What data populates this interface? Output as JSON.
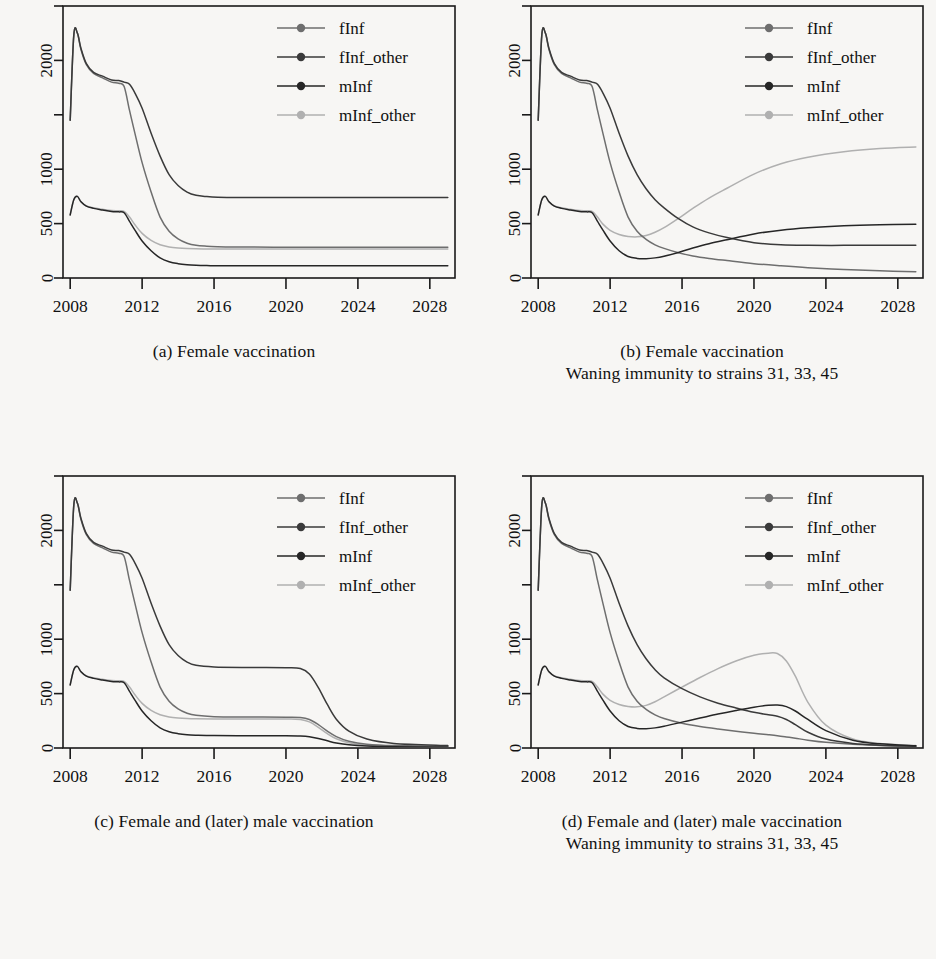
{
  "figure": {
    "background": "#f7f6f4",
    "panel_count": 4,
    "axis_color": "#1a1a1a"
  },
  "series_style": {
    "fInf": "#6e6e6e",
    "fInf_other": "#3a3a3a",
    "mInf": "#262626",
    "mInf_other": "#b0b0b0"
  },
  "legend": {
    "items": [
      {
        "label": "fInf",
        "color": "#6e6e6e"
      },
      {
        "label": "fInf_other",
        "color": "#3a3a3a"
      },
      {
        "label": "mInf",
        "color": "#262626"
      },
      {
        "label": "mInf_other",
        "color": "#b0b0b0"
      }
    ]
  },
  "axes": {
    "xlim": [
      2007.6,
      2029.4
    ],
    "ylim": [
      0,
      2500
    ],
    "xticks": [
      2008,
      2012,
      2016,
      2020,
      2024,
      2028
    ],
    "xtick_labels": [
      "2008",
      "2012",
      "2016",
      "2020",
      "2024",
      "2028"
    ],
    "yticks": [
      0,
      500,
      1000,
      1500,
      2000,
      2500
    ],
    "ytick_labels": [
      "0",
      "500",
      "1000",
      "",
      "2000",
      ""
    ],
    "grid": false,
    "legend_position": "top-right"
  },
  "panels": [
    {
      "id": "a",
      "caption_lines": [
        "(a) Female vaccination"
      ],
      "chart_data": {
        "type": "line",
        "title": "(a) Female vaccination",
        "xlabel": "",
        "ylabel": "",
        "xlim": [
          2007.6,
          2029.4
        ],
        "ylim": [
          0,
          2500
        ],
        "x": [
          2008.0,
          2008.2,
          2008.4,
          2008.6,
          2008.9,
          2009.3,
          2009.8,
          2010.3,
          2010.7,
          2011.0,
          2011.3,
          2011.6,
          2012.0,
          2012.5,
          2013.0,
          2013.5,
          2014.0,
          2014.5,
          2015.0,
          2015.6,
          2016.2,
          2017.0,
          2018.0,
          2020.0,
          2022.0,
          2024.0,
          2026.0,
          2029.0
        ],
        "series": [
          {
            "name": "fInf",
            "color": "#6e6e6e",
            "values": [
              1450,
              2230,
              2250,
              2100,
              1960,
              1880,
              1840,
              1800,
              1790,
              1760,
              1540,
              1330,
              1060,
              790,
              560,
              430,
              360,
              320,
              300,
              292,
              288,
              285,
              284,
              283,
              283,
              283,
              283,
              283
            ]
          },
          {
            "name": "fInf_other",
            "color": "#3a3a3a",
            "values": [
              1450,
              2230,
              2250,
              2110,
              1970,
              1890,
              1855,
              1820,
              1815,
              1800,
              1780,
              1700,
              1560,
              1330,
              1120,
              950,
              850,
              790,
              760,
              748,
              742,
              740,
              740,
              740,
              740,
              740,
              740,
              740
            ]
          },
          {
            "name": "mInf",
            "color": "#262626",
            "values": [
              580,
              720,
              750,
              700,
              660,
              640,
              625,
              612,
              608,
              600,
              520,
              440,
              340,
              250,
              185,
              150,
              132,
              122,
              117,
              114,
              113,
              112,
              112,
              112,
              112,
              112,
              112,
              112
            ]
          },
          {
            "name": "mInf_other",
            "color": "#b0b0b0",
            "values": [
              580,
              720,
              750,
              700,
              662,
              645,
              632,
              620,
              618,
              612,
              560,
              490,
              410,
              345,
              305,
              285,
              275,
              270,
              268,
              267,
              267,
              267,
              267,
              267,
              267,
              267,
              267,
              267
            ]
          }
        ]
      }
    },
    {
      "id": "b",
      "caption_lines": [
        "(b) Female vaccination",
        "Waning immunity to strains 31, 33, 45"
      ],
      "chart_data": {
        "type": "line",
        "title": "(b) Female vaccination - Waning immunity to strains 31, 33, 45",
        "xlabel": "",
        "ylabel": "",
        "xlim": [
          2007.6,
          2029.4
        ],
        "ylim": [
          0,
          2500
        ],
        "x": [
          2008.0,
          2008.2,
          2008.4,
          2008.6,
          2008.9,
          2009.3,
          2009.8,
          2010.3,
          2010.7,
          2011.0,
          2011.3,
          2011.6,
          2012.0,
          2012.5,
          2013.0,
          2013.5,
          2014.0,
          2014.5,
          2015.0,
          2015.8,
          2016.6,
          2017.5,
          2018.5,
          2020.0,
          2021.5,
          2023.0,
          2025.0,
          2027.0,
          2029.0
        ],
        "series": [
          {
            "name": "fInf",
            "color": "#6e6e6e",
            "values": [
              1450,
              2230,
              2250,
              2100,
              1960,
              1880,
              1840,
              1800,
              1790,
              1760,
              1540,
              1330,
              1060,
              790,
              560,
              430,
              355,
              305,
              272,
              232,
              203,
              180,
              160,
              132,
              112,
              95,
              78,
              66,
              58
            ]
          },
          {
            "name": "fInf_other",
            "color": "#3a3a3a",
            "values": [
              1450,
              2230,
              2250,
              2110,
              1970,
              1890,
              1855,
              1820,
              1815,
              1800,
              1780,
              1700,
              1560,
              1330,
              1120,
              950,
              820,
              720,
              645,
              545,
              470,
              415,
              372,
              325,
              305,
              300,
              300,
              300,
              300
            ]
          },
          {
            "name": "mInf",
            "color": "#262626",
            "values": [
              580,
              720,
              750,
              700,
              660,
              640,
              625,
              612,
              608,
              600,
              520,
              440,
              340,
              250,
              198,
              180,
              178,
              185,
              200,
              235,
              275,
              315,
              352,
              405,
              440,
              462,
              480,
              490,
              495
            ]
          },
          {
            "name": "mInf_other",
            "color": "#b0b0b0",
            "values": [
              580,
              720,
              750,
              700,
              662,
              645,
              632,
              620,
              618,
              612,
              560,
              495,
              438,
              400,
              382,
              378,
              390,
              420,
              462,
              548,
              640,
              735,
              825,
              955,
              1050,
              1110,
              1160,
              1190,
              1205
            ]
          }
        ]
      }
    },
    {
      "id": "c",
      "caption_lines": [
        "(c) Female and (later) male vaccination"
      ],
      "chart_data": {
        "type": "line",
        "title": "(c) Female and (later) male vaccination",
        "xlabel": "",
        "ylabel": "",
        "xlim": [
          2007.6,
          2029.4
        ],
        "ylim": [
          0,
          2500
        ],
        "x": [
          2008.0,
          2008.2,
          2008.4,
          2008.6,
          2008.9,
          2009.3,
          2009.8,
          2010.3,
          2010.7,
          2011.0,
          2011.3,
          2011.6,
          2012.0,
          2012.5,
          2013.0,
          2013.5,
          2014.0,
          2014.5,
          2015.0,
          2016.0,
          2018.0,
          2020.0,
          2020.8,
          2021.3,
          2021.8,
          2022.3,
          2022.8,
          2023.5,
          2024.5,
          2026.0,
          2029.0
        ],
        "series": [
          {
            "name": "fInf",
            "color": "#6e6e6e",
            "values": [
              1450,
              2230,
              2250,
              2100,
              1960,
              1880,
              1840,
              1800,
              1790,
              1760,
              1540,
              1330,
              1060,
              790,
              560,
              430,
              360,
              320,
              300,
              288,
              285,
              283,
              280,
              262,
              215,
              155,
              105,
              62,
              35,
              22,
              15
            ]
          },
          {
            "name": "fInf_other",
            "color": "#3a3a3a",
            "values": [
              1450,
              2230,
              2250,
              2110,
              1970,
              1890,
              1855,
              1820,
              1815,
              1800,
              1780,
              1700,
              1560,
              1330,
              1120,
              950,
              850,
              790,
              760,
              745,
              740,
              738,
              730,
              680,
              555,
              400,
              265,
              155,
              82,
              42,
              22
            ]
          },
          {
            "name": "mInf",
            "color": "#262626",
            "values": [
              580,
              720,
              750,
              700,
              660,
              640,
              625,
              612,
              608,
              600,
              520,
              440,
              340,
              250,
              185,
              150,
              132,
              122,
              118,
              114,
              113,
              112,
              110,
              104,
              88,
              66,
              46,
              29,
              18,
              12,
              8
            ]
          },
          {
            "name": "mInf_other",
            "color": "#b0b0b0",
            "values": [
              580,
              720,
              750,
              700,
              662,
              645,
              632,
              620,
              618,
              612,
              560,
              490,
              410,
              345,
              305,
              285,
              275,
              270,
              268,
              267,
              267,
              266,
              262,
              240,
              190,
              132,
              85,
              48,
              26,
              16,
              10
            ]
          }
        ]
      }
    },
    {
      "id": "d",
      "caption_lines": [
        "(d) Female and (later) male vaccination",
        "Waning immunity to strains 31, 33, 45"
      ],
      "chart_data": {
        "type": "line",
        "title": "(d) Female and (later) male vaccination - Waning immunity to strains 31, 33, 45",
        "xlabel": "",
        "ylabel": "",
        "xlim": [
          2007.6,
          2029.4
        ],
        "ylim": [
          0,
          2500
        ],
        "x": [
          2008.0,
          2008.2,
          2008.4,
          2008.6,
          2008.9,
          2009.3,
          2009.8,
          2010.3,
          2010.7,
          2011.0,
          2011.3,
          2011.6,
          2012.0,
          2012.5,
          2013.0,
          2013.5,
          2014.0,
          2014.5,
          2015.0,
          2016.0,
          2017.0,
          2018.0,
          2019.0,
          2020.0,
          2020.8,
          2021.3,
          2021.8,
          2022.3,
          2023.0,
          2024.0,
          2025.5,
          2027.0,
          2029.0
        ],
        "series": [
          {
            "name": "fInf",
            "color": "#6e6e6e",
            "values": [
              1450,
              2230,
              2250,
              2100,
              1960,
              1880,
              1840,
              1800,
              1790,
              1760,
              1540,
              1330,
              1060,
              790,
              560,
              430,
              355,
              305,
              272,
              228,
              198,
              175,
              155,
              135,
              122,
              113,
              102,
              90,
              72,
              52,
              34,
              24,
              16
            ]
          },
          {
            "name": "fInf_other",
            "color": "#3a3a3a",
            "values": [
              1450,
              2230,
              2250,
              2110,
              1970,
              1890,
              1855,
              1820,
              1815,
              1800,
              1780,
              1700,
              1560,
              1330,
              1120,
              950,
              820,
              720,
              645,
              545,
              470,
              412,
              368,
              328,
              305,
              292,
              262,
              215,
              145,
              82,
              42,
              26,
              16
            ]
          },
          {
            "name": "mInf",
            "color": "#262626",
            "values": [
              580,
              720,
              750,
              700,
              660,
              640,
              625,
              612,
              608,
              600,
              520,
              440,
              340,
              250,
              198,
              180,
              178,
              185,
              200,
              238,
              275,
              312,
              345,
              375,
              392,
              395,
              380,
              340,
              262,
              160,
              72,
              38,
              20
            ]
          },
          {
            "name": "mInf_other",
            "color": "#b0b0b0",
            "values": [
              580,
              720,
              750,
              700,
              662,
              645,
              632,
              620,
              618,
              612,
              560,
              495,
              438,
              400,
              382,
              378,
              392,
              425,
              470,
              560,
              648,
              730,
              800,
              852,
              872,
              868,
              800,
              660,
              420,
              210,
              82,
              42,
              22
            ]
          }
        ]
      }
    }
  ]
}
